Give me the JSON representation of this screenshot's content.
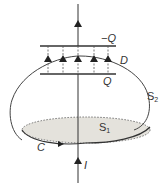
{
  "diagram": {
    "labels": {
      "top_plate": "−Q",
      "bottom_plate": "Q",
      "field": "D",
      "surface2": "S",
      "surface2_sub": "2",
      "surface1": "S",
      "surface1_sub": "1",
      "curve": "C",
      "current": "I"
    },
    "field_arrow_count": 5,
    "colors": {
      "line": "#333333",
      "disk_fill": "#e4e2dc"
    }
  }
}
